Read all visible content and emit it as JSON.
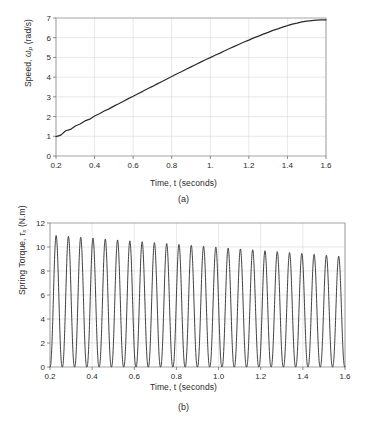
{
  "figure": {
    "panels": [
      {
        "id": "a",
        "caption": "(a)",
        "chart_data": {
          "type": "line",
          "title": "",
          "xlabel": "Time, t (seconds)",
          "ylabel": "Speed, ωp (rad/s)",
          "ylabel_main": "Speed, ",
          "ylabel_sym": "ω",
          "ylabel_sub": "p",
          "ylabel_unit": " (rad/s)",
          "xlim": [
            0.2,
            1.6
          ],
          "ylim": [
            0,
            7
          ],
          "xticks": [
            0.2,
            0.4,
            0.6,
            0.8,
            1.0,
            1.2,
            1.4,
            1.6
          ],
          "xticklabels": [
            "0.2",
            "0.4",
            "0.6",
            "0.8",
            "1.",
            "1.2",
            "1.4",
            "1.6"
          ],
          "yticks": [
            0,
            1,
            2,
            3,
            4,
            5,
            6,
            7
          ],
          "yticklabels": [
            "0",
            "1",
            "2",
            "3",
            "4",
            "5",
            "6",
            "7"
          ],
          "grid": true,
          "legend": null,
          "series": [
            {
              "name": "Speed",
              "color": "#2b2b2b",
              "description": "Nearly linear ramp from about 1.0 rad/s at t=0.2 s to about 6.9 rad/s at t=1.6 s, with small periodic ripple riding on the ramp.",
              "x": [
                0.2,
                0.225,
                0.25,
                0.275,
                0.3,
                0.325,
                0.35,
                0.375,
                0.4,
                0.425,
                0.45,
                0.475,
                0.5,
                0.525,
                0.55,
                0.575,
                0.6,
                0.625,
                0.65,
                0.675,
                0.7,
                0.725,
                0.75,
                0.775,
                0.8,
                0.825,
                0.85,
                0.875,
                0.9,
                0.925,
                0.95,
                0.975,
                1.0,
                1.025,
                1.05,
                1.075,
                1.1,
                1.125,
                1.15,
                1.175,
                1.2,
                1.225,
                1.25,
                1.275,
                1.3,
                1.325,
                1.35,
                1.375,
                1.4,
                1.425,
                1.45,
                1.475,
                1.5,
                1.525,
                1.55,
                1.575,
                1.6
              ],
              "y": [
                0.98,
                1.06,
                1.28,
                1.35,
                1.52,
                1.62,
                1.78,
                1.87,
                2.03,
                2.14,
                2.28,
                2.39,
                2.53,
                2.65,
                2.78,
                2.91,
                3.03,
                3.16,
                3.28,
                3.41,
                3.53,
                3.66,
                3.78,
                3.91,
                4.03,
                4.16,
                4.27,
                4.4,
                4.52,
                4.64,
                4.76,
                4.88,
                4.99,
                5.11,
                5.22,
                5.34,
                5.45,
                5.56,
                5.67,
                5.78,
                5.88,
                5.99,
                6.08,
                6.18,
                6.27,
                6.37,
                6.45,
                6.54,
                6.61,
                6.69,
                6.74,
                6.8,
                6.84,
                6.87,
                6.89,
                6.9,
                6.9
              ]
            }
          ]
        }
      },
      {
        "id": "b",
        "caption": "(b)",
        "chart_data": {
          "type": "line",
          "title": "",
          "xlabel": "Time, t (seconds)",
          "ylabel": "Spring Torque, τs (N.m)",
          "ylabel_main": "Spring Torque, ",
          "ylabel_sym": "τ",
          "ylabel_sub": "s",
          "ylabel_unit": " (N.m)",
          "xlim": [
            0.2,
            1.6
          ],
          "ylim": [
            0,
            12
          ],
          "xticks": [
            0.2,
            0.4,
            0.6,
            0.8,
            1.0,
            1.2,
            1.4,
            1.6
          ],
          "xticklabels": [
            "0.2",
            "0.4",
            "0.6",
            "0.8",
            "1.0",
            "1.2",
            "1.4",
            "1.6"
          ],
          "yticks": [
            0,
            2,
            4,
            6,
            8,
            10,
            12
          ],
          "yticklabels": [
            "0",
            "2",
            "4",
            "6",
            "8",
            "10",
            "12"
          ],
          "grid": true,
          "legend": null,
          "series": [
            {
              "name": "Spring Torque",
              "color": "#2b2b2b",
              "description": "Sustained oscillation between about 0 N.m and a peak that slowly decays from about 11.0 N.m near t=0.23 s to about 9.2 N.m near t=1.55 s; roughly 24 cycles over 0.2-1.6 s (period about 0.058 s).",
              "peak_start": 11.0,
              "peak_end": 9.2,
              "trough": 0.0,
              "cycles": 24,
              "period": 0.0583,
              "phase_start": 0.2
            }
          ]
        }
      }
    ]
  }
}
